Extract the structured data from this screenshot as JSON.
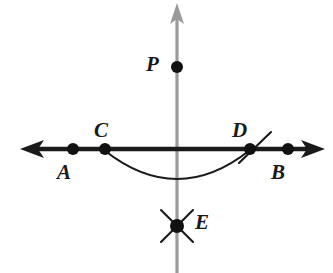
{
  "figure": {
    "background_color": "#ffffff",
    "width": 333,
    "height": 273
  },
  "colors": {
    "line_black": "#1a1a1a",
    "axis_gray": "#9a9a9a",
    "point_fill": "#111111"
  },
  "lines": [
    {
      "name": "horizontal-line-AB",
      "orientation": "horizontal",
      "color": "#1a1a1a",
      "x1": 20,
      "y1": 149,
      "x2": 325,
      "y2": 149,
      "arrow_start": true,
      "arrow_end": true
    },
    {
      "name": "vertical-line-PE",
      "orientation": "vertical",
      "color": "#9a9a9a",
      "x1": 177,
      "y1": 3,
      "x2": 177,
      "y2": 273,
      "arrow_start": false,
      "arrow_end": true
    }
  ],
  "arc": {
    "name": "construction-arc-CD",
    "start_x": 104,
    "start_y": 150,
    "end_x": 250,
    "end_y": 150,
    "lowest_x": 177,
    "lowest_y": 179,
    "color": "#1a1a1a"
  },
  "tick_mark": {
    "name": "arc-tick-at-D",
    "x1": 239,
    "y1": 163,
    "x2": 271,
    "y2": 132,
    "color": "#1a1a1a"
  },
  "cross_mark": {
    "name": "arc-intersection-cross-at-E",
    "center_x": 177,
    "center_y": 226,
    "arm_length": 16,
    "color": "#1a1a1a"
  },
  "points": [
    {
      "id": "A",
      "label": "A",
      "x": 73,
      "y": 149,
      "radius": 6,
      "label_x": 57,
      "label_y": 162,
      "label_position": "below-left"
    },
    {
      "id": "C",
      "label": "C",
      "x": 105,
      "y": 149,
      "radius": 6,
      "label_x": 94,
      "label_y": 120,
      "label_position": "above-left"
    },
    {
      "id": "D",
      "label": "D",
      "x": 250,
      "y": 149,
      "radius": 6,
      "label_x": 232,
      "label_y": 120,
      "label_position": "above-left"
    },
    {
      "id": "B",
      "label": "B",
      "x": 288,
      "y": 149,
      "radius": 6,
      "label_x": 271,
      "label_y": 162,
      "label_position": "below-left"
    },
    {
      "id": "P",
      "label": "P",
      "x": 177,
      "y": 67,
      "radius": 6,
      "label_x": 146,
      "label_y": 54,
      "label_position": "left"
    },
    {
      "id": "E",
      "label": "E",
      "x": 177,
      "y": 226,
      "radius": 7,
      "label_x": 195,
      "label_y": 212,
      "label_position": "right"
    }
  ]
}
